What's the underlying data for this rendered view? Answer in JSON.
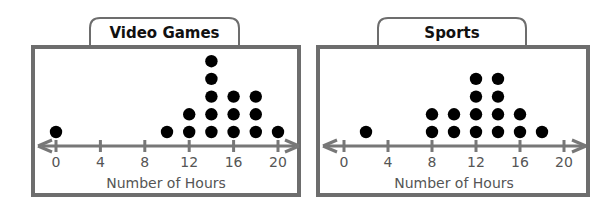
{
  "chart_data": [
    {
      "type": "dot_plot",
      "title": "Video Games",
      "xlabel": "Number of Hours",
      "ylabel": "",
      "xlim": [
        0,
        20
      ],
      "tick_labels": [
        "0",
        "4",
        "8",
        "12",
        "16",
        "20"
      ],
      "ticks": [
        0,
        4,
        8,
        12,
        16,
        20
      ],
      "categories": [
        0,
        10,
        12,
        14,
        16,
        18,
        20
      ],
      "values": [
        1,
        1,
        2,
        5,
        3,
        3,
        1
      ],
      "grid": false,
      "legend": null
    },
    {
      "type": "dot_plot",
      "title": "Sports",
      "xlabel": "Number of Hours",
      "ylabel": "",
      "xlim": [
        0,
        20
      ],
      "tick_labels": [
        "0",
        "4",
        "8",
        "12",
        "16",
        "20"
      ],
      "ticks": [
        0,
        4,
        8,
        12,
        16,
        20
      ],
      "categories": [
        2,
        8,
        10,
        12,
        14,
        16,
        18
      ],
      "values": [
        1,
        2,
        2,
        4,
        4,
        2,
        1
      ],
      "grid": false,
      "legend": null
    }
  ],
  "panels": [
    {
      "title": "Video Games",
      "xlabel": "Number of Hours",
      "tick_labels": [
        "0",
        "4",
        "8",
        "12",
        "16",
        "20"
      ]
    },
    {
      "title": "Sports",
      "xlabel": "Number of Hours",
      "tick_labels": [
        "0",
        "4",
        "8",
        "12",
        "16",
        "20"
      ]
    }
  ],
  "colors": {
    "frame": "#6d6d6d",
    "axis": "#777777",
    "dot": "#000000",
    "text_title": "#111111",
    "text_axis": "#555555"
  }
}
